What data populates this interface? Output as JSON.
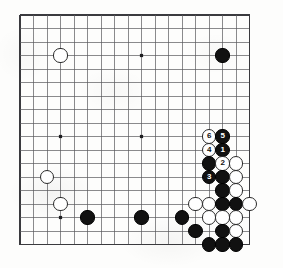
{
  "diagram": {
    "kind": "go-board-diagram",
    "board_size_lines": 18,
    "origin_x": 20,
    "origin_y": 15,
    "cell": 13.5,
    "line_color": "#58585c",
    "border_color": "#3a3a3e",
    "background_color": "#fdfdfc",
    "black_color": "#111111",
    "white_color": "#ffffff",
    "star_points": [
      {
        "col": 3,
        "row": 3
      },
      {
        "col": 9,
        "row": 3
      },
      {
        "col": 15,
        "row": 3
      },
      {
        "col": 3,
        "row": 9
      },
      {
        "col": 9,
        "row": 9
      },
      {
        "col": 15,
        "row": 9
      },
      {
        "col": 3,
        "row": 15
      },
      {
        "col": 9,
        "row": 15
      },
      {
        "col": 15,
        "row": 15
      }
    ],
    "visible_star_points": [
      {
        "col": 3,
        "row": 9
      },
      {
        "col": 9,
        "row": 3
      },
      {
        "col": 9,
        "row": 9
      }
    ],
    "stones": [
      {
        "id": "w-upper-left-star",
        "color": "white",
        "col": 3,
        "row": 3,
        "label": ""
      },
      {
        "id": "b-upper-right",
        "color": "black",
        "col": 15,
        "row": 3,
        "label": ""
      },
      {
        "id": "w-move-6",
        "color": "white",
        "col": 14,
        "row": 9,
        "label": "6"
      },
      {
        "id": "b-move-5",
        "color": "black",
        "col": 15,
        "row": 9,
        "label": "5"
      },
      {
        "id": "w-move-4",
        "color": "white",
        "col": 14,
        "row": 10,
        "label": "4"
      },
      {
        "id": "b-move-1",
        "color": "black",
        "col": 15,
        "row": 10,
        "label": "1"
      },
      {
        "id": "b-c14r11",
        "color": "black",
        "col": 14,
        "row": 11,
        "label": ""
      },
      {
        "id": "w-move-2",
        "color": "white",
        "col": 15,
        "row": 11,
        "label": "2"
      },
      {
        "id": "w-c16r11",
        "color": "white",
        "col": 16,
        "row": 11,
        "label": ""
      },
      {
        "id": "b-move-3",
        "color": "black",
        "col": 14,
        "row": 12,
        "label": "3"
      },
      {
        "id": "b-c15r12",
        "color": "black",
        "col": 15,
        "row": 12,
        "label": ""
      },
      {
        "id": "w-c16r12",
        "color": "white",
        "col": 16,
        "row": 12,
        "label": ""
      },
      {
        "id": "b-c15r13",
        "color": "black",
        "col": 15,
        "row": 13,
        "label": ""
      },
      {
        "id": "w-c16r13",
        "color": "white",
        "col": 16,
        "row": 13,
        "label": ""
      },
      {
        "id": "w-c13r14",
        "color": "white",
        "col": 13,
        "row": 14,
        "label": ""
      },
      {
        "id": "w-c14r14",
        "color": "white",
        "col": 14,
        "row": 14,
        "label": ""
      },
      {
        "id": "b-c15r14",
        "color": "black",
        "col": 15,
        "row": 14,
        "label": ""
      },
      {
        "id": "b-c16r14",
        "color": "black",
        "col": 16,
        "row": 14,
        "label": ""
      },
      {
        "id": "w-c17r14",
        "color": "white",
        "col": 17,
        "row": 14,
        "label": ""
      },
      {
        "id": "w-c3r12",
        "color": "white",
        "col": 2,
        "row": 12,
        "label": ""
      },
      {
        "id": "w-c3r14",
        "color": "white",
        "col": 3,
        "row": 14,
        "label": ""
      },
      {
        "id": "b-c5r15",
        "color": "black",
        "col": 5,
        "row": 15,
        "label": ""
      },
      {
        "id": "b-c9r15",
        "color": "black",
        "col": 9,
        "row": 15,
        "label": ""
      },
      {
        "id": "b-c12r15",
        "color": "black",
        "col": 12,
        "row": 15,
        "label": ""
      },
      {
        "id": "w-c14r15",
        "color": "white",
        "col": 14,
        "row": 15,
        "label": ""
      },
      {
        "id": "w-c15r15",
        "color": "white",
        "col": 15,
        "row": 15,
        "label": ""
      },
      {
        "id": "w-c16r15",
        "color": "white",
        "col": 16,
        "row": 15,
        "label": ""
      },
      {
        "id": "b-c13r16",
        "color": "black",
        "col": 13,
        "row": 16,
        "label": ""
      },
      {
        "id": "b-c15r16",
        "color": "black",
        "col": 15,
        "row": 16,
        "label": ""
      },
      {
        "id": "w-c16r16",
        "color": "white",
        "col": 16,
        "row": 16,
        "label": ""
      },
      {
        "id": "b-c14r17",
        "color": "black",
        "col": 14,
        "row": 17,
        "label": ""
      },
      {
        "id": "b-c15r17",
        "color": "black",
        "col": 15,
        "row": 17,
        "label": ""
      },
      {
        "id": "b-c16r17",
        "color": "black",
        "col": 16,
        "row": 17,
        "label": ""
      }
    ],
    "move_sequence": [
      {
        "number": "1",
        "color": "black"
      },
      {
        "number": "2",
        "color": "white"
      },
      {
        "number": "3",
        "color": "black"
      },
      {
        "number": "4",
        "color": "white"
      },
      {
        "number": "5",
        "color": "black"
      },
      {
        "number": "6",
        "color": "white"
      }
    ]
  }
}
